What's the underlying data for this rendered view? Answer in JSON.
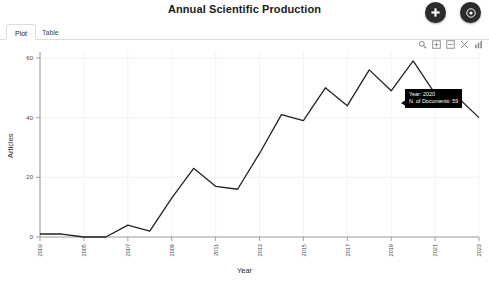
{
  "header": {
    "title": "Annual Scientific Production",
    "buttons": [
      {
        "name": "add-button",
        "icon": "plus-icon",
        "label": "+"
      },
      {
        "name": "info-button",
        "icon": "info-circle-icon",
        "label": "i"
      }
    ]
  },
  "tabs": [
    {
      "label": "Plot",
      "active": true
    },
    {
      "label": "Table",
      "active": false
    }
  ],
  "modebar": {
    "items": [
      {
        "label": "Zoom",
        "icon": "magnifier-icon"
      },
      {
        "label": "Zoom in",
        "icon": "zoom-in-icon"
      },
      {
        "label": "Zoom out",
        "icon": "zoom-out-icon"
      },
      {
        "label": "Autoscale",
        "icon": "autoscale-icon"
      },
      {
        "label": "Reset axes",
        "icon": "reset-axes-icon"
      }
    ]
  },
  "tooltip": {
    "year_line": "Year:  2020",
    "docs_line": "N. of Documents:  59"
  },
  "chart_data": {
    "type": "line",
    "title": "Annual Scientific Production",
    "xlabel": "Year",
    "ylabel": "Articles",
    "xlim": [
      2003,
      2023
    ],
    "ylim": [
      0,
      62
    ],
    "xticks": [
      2003,
      2005,
      2007,
      2009,
      2011,
      2013,
      2015,
      2017,
      2019,
      2021,
      2023
    ],
    "yticks": [
      0,
      20,
      40,
      60
    ],
    "grid": true,
    "legend": "none",
    "line_color": "#222222",
    "x": [
      2003,
      2004,
      2005,
      2006,
      2007,
      2008,
      2009,
      2010,
      2011,
      2012,
      2013,
      2014,
      2015,
      2016,
      2017,
      2018,
      2019,
      2020,
      2021,
      2022,
      2023
    ],
    "values": [
      1,
      1,
      0,
      0,
      4,
      2,
      13,
      23,
      17,
      16,
      28,
      41,
      39,
      50,
      44,
      56,
      49,
      59,
      48,
      47,
      40
    ],
    "annotations": [
      {
        "x": 2020,
        "y": 59,
        "text": "Year: 2020 / N. of Documents: 59"
      }
    ]
  }
}
